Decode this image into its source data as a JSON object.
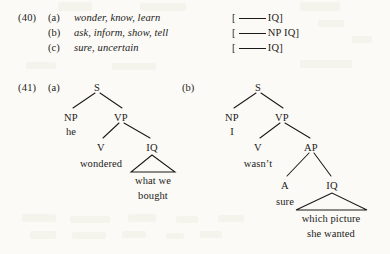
{
  "page": {
    "background_color": "#fbfaf7",
    "ink_color": "#1c1a18"
  },
  "examples": [
    {
      "number": "(41)",
      "id": "example-40",
      "number_label": "(40)",
      "items": [
        {
          "letter": "(a)",
          "verbs": "wonder, know, learn",
          "frame_open": "[",
          "frame_tail": "IQ]"
        },
        {
          "letter": "(b)",
          "verbs": "ask, inform, show, tell",
          "frame_open": "[",
          "frame_tail": "NP IQ]"
        },
        {
          "letter": "(c)",
          "verbs": "sure, uncertain",
          "frame_open": "[",
          "frame_tail": "IQ]"
        }
      ]
    }
  ],
  "example40": {
    "number": "(40)",
    "rows": [
      {
        "letter": "(a)",
        "verbs": "wonder, know, learn",
        "bracket_open": "[",
        "bracket_tail": "IQ]"
      },
      {
        "letter": "(b)",
        "verbs": "ask, inform, show, tell",
        "bracket_open": "[",
        "bracket_tail": "NP IQ]"
      },
      {
        "letter": "(c)",
        "verbs": "sure, uncertain",
        "bracket_open": "[",
        "bracket_tail": "IQ]"
      }
    ]
  },
  "example41": {
    "number": "(41)",
    "trees": [
      {
        "letter": "(a)",
        "root": "S",
        "nodes": {
          "s": "S",
          "np": "NP",
          "vp": "VP",
          "v": "V",
          "iq": "IQ"
        },
        "leaves": {
          "np_word": "he",
          "v_word": "wondered",
          "iq_line1": "what we",
          "iq_line2": "bought"
        }
      },
      {
        "letter": "(b)",
        "root": "S",
        "nodes": {
          "s": "S",
          "np": "NP",
          "vp": "VP",
          "v": "V",
          "ap": "AP",
          "a": "A",
          "iq": "IQ"
        },
        "leaves": {
          "np_word": "I",
          "v_word": "wasn’t",
          "a_word": "sure",
          "iq_line1": "which picture",
          "iq_line2": "she wanted"
        }
      }
    ]
  }
}
